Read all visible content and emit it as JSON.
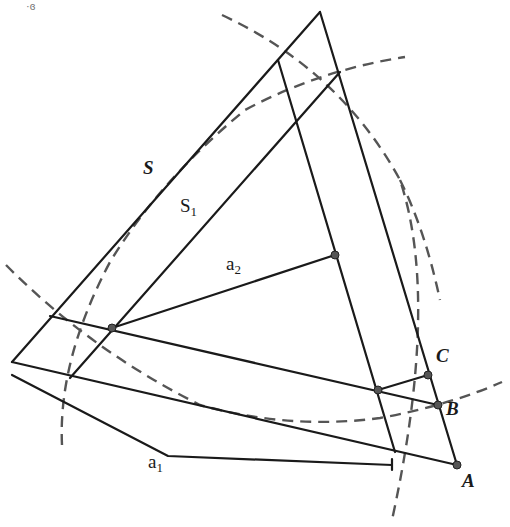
{
  "figure": {
    "corner_mark": "·ɞ",
    "labels": {
      "S": "S",
      "S1_base": "S",
      "S1_sub": "1",
      "a2_base": "a",
      "a2_sub": "2",
      "a1_base": "a",
      "a1_sub": "1",
      "A": "A",
      "B": "B",
      "C": "C"
    },
    "colors": {
      "line": "#1a1a1a",
      "dashed": "#555555",
      "point": "#555555",
      "background": "#ffffff"
    },
    "points": {
      "A": [
        457,
        465
      ],
      "B": [
        438,
        405
      ],
      "C": [
        428,
        375
      ],
      "P_left": [
        112,
        328
      ],
      "P_center": [
        335,
        255
      ],
      "P_bottom": [
        378,
        390
      ]
    }
  }
}
